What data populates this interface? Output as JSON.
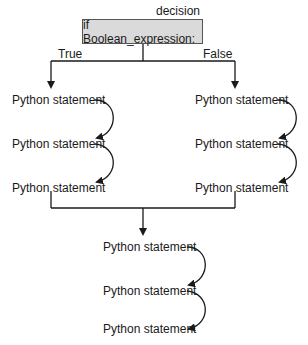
{
  "diagram": {
    "decision_label": "decision",
    "decision_text": "if Boolean_expression:",
    "branches": {
      "true_label": "True",
      "false_label": "False"
    },
    "true_branch": {
      "statements": [
        "Python statement",
        "Python statement",
        "Python statement"
      ]
    },
    "false_branch": {
      "statements": [
        "Python statement",
        "Python statement",
        "Python statement"
      ]
    },
    "after_merge": {
      "statements": [
        "Python statement",
        "Python statement",
        "Python statement"
      ]
    },
    "colors": {
      "box_fill": "#dadada",
      "box_border": "#555555",
      "line": "#1a1a1a",
      "background": "#ffffff"
    }
  }
}
